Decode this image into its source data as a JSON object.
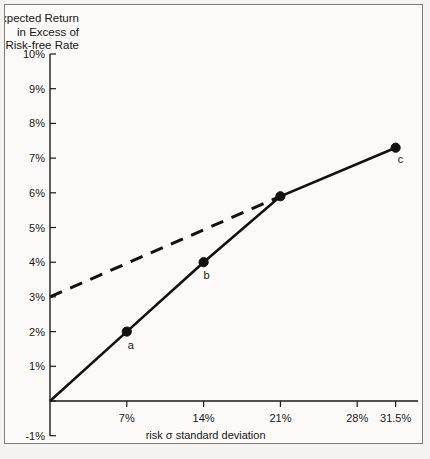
{
  "figure": {
    "title_lines": [
      "Expected Return",
      "in Excess of",
      "Risk-free Rate"
    ],
    "background_color": "#f4f3f1",
    "panel_color": "#fbfaf8",
    "frame_color": "#7d7d7a",
    "ink_color": "#111111"
  },
  "chart_data": {
    "type": "line",
    "xlabel": "risk σ standard deviation",
    "ylabel": "Expected Return in Excess of Risk-free Rate",
    "xlim": [
      0,
      33.5
    ],
    "ylim": [
      -1,
      10
    ],
    "grid": false,
    "legend": "none",
    "xticks": [
      7,
      14,
      21,
      28,
      31.5
    ],
    "xticklabels": [
      "7%",
      "14%",
      "21%",
      "28%",
      "31.5%"
    ],
    "yticks": [
      -1,
      0,
      1,
      2,
      3,
      4,
      5,
      6,
      7,
      8,
      9,
      10
    ],
    "yticklabels": [
      "-1%",
      "",
      "1%",
      "2%",
      "3%",
      "4%",
      "5%",
      "6%",
      "7%",
      "8%",
      "9%",
      "10%"
    ],
    "series": [
      {
        "name": "efficient-frontier-solid",
        "style": "solid",
        "x": [
          0,
          7,
          14,
          21,
          31.5
        ],
        "y": [
          0,
          2,
          4,
          5.9,
          7.3
        ]
      },
      {
        "name": "capital-allocation-dashed",
        "style": "dashed",
        "x": [
          0,
          21
        ],
        "y": [
          3,
          5.9
        ]
      }
    ],
    "points": [
      {
        "label": "a",
        "x": 7,
        "y": 2,
        "label_dx": 4,
        "label_dy": 17
      },
      {
        "label": "b",
        "x": 14,
        "y": 4,
        "label_dx": 3,
        "label_dy": 17
      },
      {
        "label": "",
        "x": 21,
        "y": 5.9,
        "label_dx": 0,
        "label_dy": 0
      },
      {
        "label": "c",
        "x": 31.5,
        "y": 7.3,
        "label_dx": 5,
        "label_dy": 15
      }
    ]
  },
  "geometry": {
    "x_axis_px": {
      "x0": 50,
      "x1": 418,
      "value0": 0,
      "value1": 33.54
    },
    "y_axis_px": {
      "y0": 401,
      "y1": 54,
      "value0": 0,
      "value1": 10
    },
    "y_axis_bottom_px": 436,
    "x_axis_right_px": 418,
    "tick_len": 6,
    "marker_radius": 4.6
  }
}
